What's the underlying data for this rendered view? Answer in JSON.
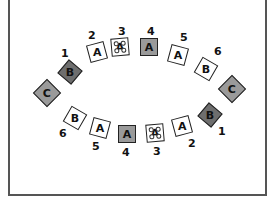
{
  "diagram": {
    "colors": {
      "white_tile": "#ffffff",
      "gray_tile": "#9a9a9a",
      "dark_tile": "#6e6e6e",
      "outline": "#222222"
    },
    "top_row": [
      {
        "letter": "C",
        "number": "",
        "style": "gray"
      },
      {
        "letter": "B",
        "number": "1",
        "style": "dark"
      },
      {
        "letter": "A",
        "number": "2",
        "style": "white"
      },
      {
        "letter": "A",
        "number": "3",
        "style": "white-dotted"
      },
      {
        "letter": "A",
        "number": "4",
        "style": "gray"
      },
      {
        "letter": "A",
        "number": "5",
        "style": "white"
      },
      {
        "letter": "B",
        "number": "6",
        "style": "white"
      },
      {
        "letter": "C",
        "number": "",
        "style": "gray"
      }
    ],
    "bottom_row": [
      {
        "letter": "B",
        "number": "6",
        "style": "white"
      },
      {
        "letter": "A",
        "number": "5",
        "style": "white"
      },
      {
        "letter": "A",
        "number": "4",
        "style": "gray"
      },
      {
        "letter": "A",
        "number": "3",
        "style": "white-dotted"
      },
      {
        "letter": "A",
        "number": "2",
        "style": "white"
      },
      {
        "letter": "B",
        "number": "1",
        "style": "dark"
      }
    ]
  }
}
